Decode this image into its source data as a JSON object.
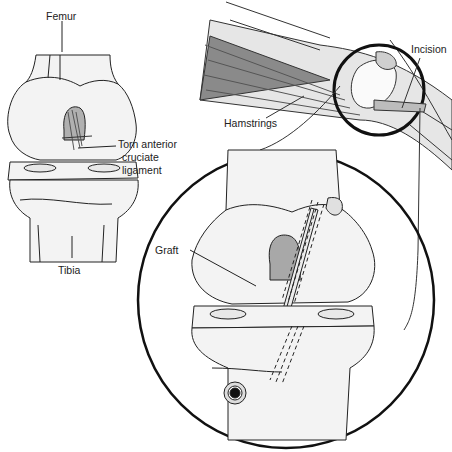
{
  "figure": {
    "labels": {
      "femur": "Femur",
      "torn_acl_line1": "Torn anterior",
      "torn_acl_line2": "cruciate",
      "torn_acl_line3": "ligament",
      "tibia": "Tibia",
      "hamstrings": "Hamstrings",
      "incision": "Incision",
      "graft": "Graft"
    },
    "colors": {
      "outline": "#1a1a1a",
      "bone": "#f2f2f2",
      "shade": "#a8a8a8",
      "muscle": "#8c8c8c"
    }
  }
}
